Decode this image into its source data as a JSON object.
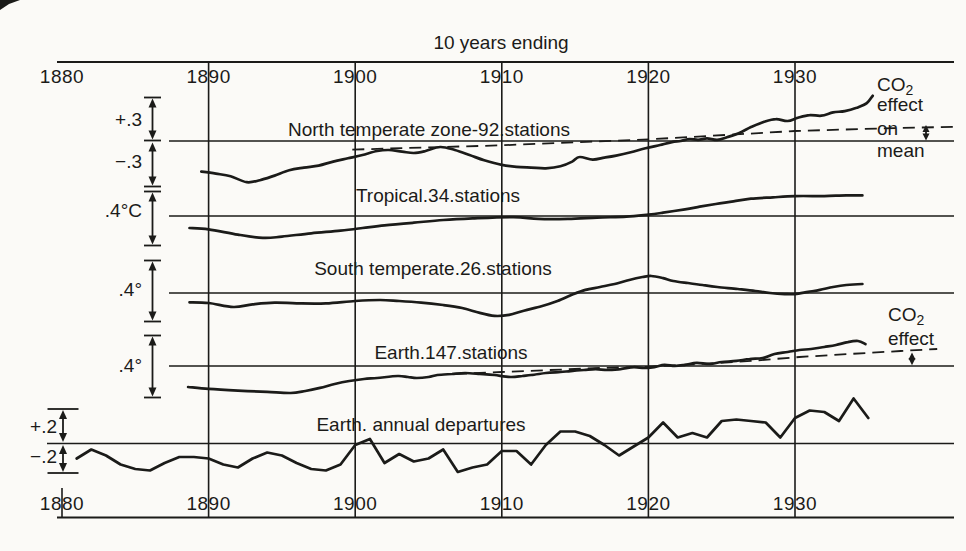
{
  "figure": {
    "top_axis_title": "10 years ending",
    "ink_color": "#1b1b19",
    "background_color": "#fbfaf7"
  },
  "axis": {
    "years": [
      "1880",
      "1890",
      "1900",
      "1910",
      "1920",
      "1930"
    ]
  },
  "scale_labels": [
    "+.3",
    "−.3",
    ".4°C",
    ".4°",
    ".4°",
    "+.2",
    "−.2"
  ],
  "annotations": {
    "co2_mean_lines": [
      "CO₂",
      "effect",
      "on",
      "mean"
    ],
    "co2_effect_lines": [
      "CO₂",
      "effect"
    ]
  },
  "chart_data": [
    {
      "panel": "north_temperate",
      "type": "line",
      "title": "North temperate zone-92.stations",
      "y_unit": "°C departure",
      "x_range": [
        1880,
        1940
      ],
      "x_ticks": [
        1880,
        1890,
        1900,
        1910,
        1920,
        1930
      ],
      "series": [
        {
          "name": "10-year running mean",
          "style": "solid",
          "interpolation": "smooth",
          "points": [
            [
              1889.5,
              -0.23
            ],
            [
              1890.5,
              -0.245
            ],
            [
              1891.5,
              -0.265
            ],
            [
              1892.6,
              -0.31
            ],
            [
              1893.5,
              -0.295
            ],
            [
              1894.5,
              -0.26
            ],
            [
              1895.5,
              -0.22
            ],
            [
              1896.5,
              -0.2
            ],
            [
              1897.5,
              -0.185
            ],
            [
              1898.5,
              -0.155
            ],
            [
              1899.5,
              -0.13
            ],
            [
              1900.5,
              -0.105
            ],
            [
              1901.5,
              -0.075
            ],
            [
              1902.3,
              -0.068
            ],
            [
              1903.2,
              -0.08
            ],
            [
              1904,
              -0.09
            ],
            [
              1904.8,
              -0.075
            ],
            [
              1905.8,
              -0.045
            ],
            [
              1906.8,
              -0.068
            ],
            [
              1907.8,
              -0.105
            ],
            [
              1908.8,
              -0.145
            ],
            [
              1910,
              -0.18
            ],
            [
              1911,
              -0.195
            ],
            [
              1912,
              -0.2
            ],
            [
              1913,
              -0.205
            ],
            [
              1914,
              -0.19
            ],
            [
              1914.8,
              -0.155
            ],
            [
              1915.3,
              -0.12
            ],
            [
              1916.2,
              -0.14
            ],
            [
              1917,
              -0.125
            ],
            [
              1917.8,
              -0.11
            ],
            [
              1918.8,
              -0.085
            ],
            [
              1919.8,
              -0.055
            ],
            [
              1920.8,
              -0.03
            ],
            [
              1921.6,
              -0.008
            ],
            [
              1922.2,
              0
            ],
            [
              1922.8,
              0.015
            ],
            [
              1923.4,
              0.008
            ],
            [
              1924,
              0.02
            ],
            [
              1924.7,
              0.008
            ],
            [
              1925.4,
              0.03
            ],
            [
              1926.2,
              0.06
            ],
            [
              1927,
              0.105
            ],
            [
              1927.9,
              0.145
            ],
            [
              1928.7,
              0.165
            ],
            [
              1929.5,
              0.15
            ],
            [
              1930.2,
              0.175
            ],
            [
              1931,
              0.195
            ],
            [
              1931.8,
              0.19
            ],
            [
              1932.6,
              0.215
            ],
            [
              1933.4,
              0.225
            ],
            [
              1934.2,
              0.25
            ],
            [
              1934.9,
              0.285
            ],
            [
              1935.3,
              0.34
            ]
          ]
        },
        {
          "name": "CO₂ effect on mean",
          "style": "dashed",
          "interpolation": "linear",
          "points": [
            [
              1899.8,
              -0.065
            ],
            [
              1910,
              -0.032
            ],
            [
              1920,
              0.012
            ],
            [
              1930,
              0.075
            ],
            [
              1936,
              0.095
            ],
            [
              1940.8,
              0.107
            ]
          ]
        }
      ]
    },
    {
      "panel": "tropical",
      "type": "line",
      "title": "Tropical.34.stations",
      "y_unit": "°C departure",
      "series": [
        {
          "name": "10-year running mean",
          "style": "solid",
          "interpolation": "smooth",
          "points": [
            [
              1888.7,
              -0.09
            ],
            [
              1890,
              -0.1
            ],
            [
              1892,
              -0.14
            ],
            [
              1893.7,
              -0.165
            ],
            [
              1895,
              -0.155
            ],
            [
              1897,
              -0.13
            ],
            [
              1899,
              -0.11
            ],
            [
              1900.5,
              -0.09
            ],
            [
              1902,
              -0.07
            ],
            [
              1904,
              -0.05
            ],
            [
              1906,
              -0.03
            ],
            [
              1908,
              -0.018
            ],
            [
              1910.8,
              -0.008
            ],
            [
              1912.5,
              -0.022
            ],
            [
              1914.5,
              -0.022
            ],
            [
              1916.5,
              -0.012
            ],
            [
              1918.5,
              -0.005
            ],
            [
              1920,
              0.01
            ],
            [
              1921,
              0.025
            ],
            [
              1922.5,
              0.05
            ],
            [
              1923.5,
              0.07
            ],
            [
              1924.6,
              0.09
            ],
            [
              1925.8,
              0.11
            ],
            [
              1927,
              0.13
            ],
            [
              1928.5,
              0.14
            ],
            [
              1930,
              0.15
            ],
            [
              1932,
              0.15
            ],
            [
              1933.5,
              0.155
            ],
            [
              1934.6,
              0.155
            ]
          ]
        }
      ]
    },
    {
      "panel": "south_temperate",
      "type": "line",
      "title": "South temperate.26.stations",
      "y_unit": "°C departure",
      "series": [
        {
          "name": "10-year running mean",
          "style": "solid",
          "interpolation": "smooth",
          "points": [
            [
              1888.7,
              -0.07
            ],
            [
              1890,
              -0.075
            ],
            [
              1891.7,
              -0.105
            ],
            [
              1893,
              -0.085
            ],
            [
              1894.5,
              -0.072
            ],
            [
              1896,
              -0.078
            ],
            [
              1898,
              -0.078
            ],
            [
              1900,
              -0.06
            ],
            [
              1901.7,
              -0.053
            ],
            [
              1903,
              -0.06
            ],
            [
              1904.5,
              -0.072
            ],
            [
              1906,
              -0.09
            ],
            [
              1907.3,
              -0.113
            ],
            [
              1908.5,
              -0.15
            ],
            [
              1909.5,
              -0.172
            ],
            [
              1910.5,
              -0.165
            ],
            [
              1911.5,
              -0.133
            ],
            [
              1912.7,
              -0.1
            ],
            [
              1913.8,
              -0.06
            ],
            [
              1914.9,
              -0.008
            ],
            [
              1915.7,
              0.023
            ],
            [
              1916.7,
              0.045
            ],
            [
              1917.7,
              0.068
            ],
            [
              1918.7,
              0.098
            ],
            [
              1919.6,
              0.12
            ],
            [
              1920.2,
              0.128
            ],
            [
              1921,
              0.112
            ],
            [
              1921.7,
              0.09
            ],
            [
              1922.7,
              0.075
            ],
            [
              1923.7,
              0.06
            ],
            [
              1924.7,
              0.045
            ],
            [
              1926.1,
              0.03
            ],
            [
              1927.3,
              0.015
            ],
            [
              1928.3,
              0
            ],
            [
              1929.3,
              -0.008
            ],
            [
              1930,
              -0.008
            ],
            [
              1930.9,
              0.008
            ],
            [
              1931.7,
              0.023
            ],
            [
              1932.6,
              0.045
            ],
            [
              1933.5,
              0.06
            ],
            [
              1934.6,
              0.068
            ]
          ]
        }
      ]
    },
    {
      "panel": "earth",
      "type": "line",
      "title": "Earth.147.stations",
      "y_unit": "°C departure",
      "series": [
        {
          "name": "10-year running mean",
          "style": "solid",
          "interpolation": "smooth",
          "points": [
            [
              1888.6,
              -0.158
            ],
            [
              1890,
              -0.172
            ],
            [
              1892,
              -0.185
            ],
            [
              1894,
              -0.195
            ],
            [
              1895.6,
              -0.203
            ],
            [
              1896.6,
              -0.188
            ],
            [
              1897.6,
              -0.165
            ],
            [
              1898.6,
              -0.135
            ],
            [
              1899.6,
              -0.113
            ],
            [
              1900.6,
              -0.098
            ],
            [
              1901.5,
              -0.09
            ],
            [
              1902.9,
              -0.075
            ],
            [
              1903.6,
              -0.083
            ],
            [
              1904.2,
              -0.09
            ],
            [
              1905,
              -0.083
            ],
            [
              1905.6,
              -0.068
            ],
            [
              1906.6,
              -0.06
            ],
            [
              1907.5,
              -0.053
            ],
            [
              1908.5,
              -0.06
            ],
            [
              1909.5,
              -0.068
            ],
            [
              1910.6,
              -0.083
            ],
            [
              1911.4,
              -0.075
            ],
            [
              1912,
              -0.068
            ],
            [
              1913,
              -0.053
            ],
            [
              1914,
              -0.045
            ],
            [
              1914.7,
              -0.038
            ],
            [
              1915.6,
              -0.03
            ],
            [
              1916.4,
              -0.023
            ],
            [
              1917.2,
              -0.03
            ],
            [
              1918.1,
              -0.023
            ],
            [
              1919,
              -0.008
            ],
            [
              1919.7,
              -0.015
            ],
            [
              1920.4,
              -0.008
            ],
            [
              1921.1,
              0.008
            ],
            [
              1921.8,
              0
            ],
            [
              1922.5,
              0.008
            ],
            [
              1923.3,
              0.023
            ],
            [
              1924.2,
              0.015
            ],
            [
              1925,
              0.03
            ],
            [
              1926,
              0.038
            ],
            [
              1926.9,
              0.053
            ],
            [
              1927.8,
              0.06
            ],
            [
              1928.6,
              0.09
            ],
            [
              1929.5,
              0.105
            ],
            [
              1930.3,
              0.12
            ],
            [
              1931.1,
              0.128
            ],
            [
              1932,
              0.143
            ],
            [
              1932.8,
              0.158
            ],
            [
              1933.6,
              0.18
            ],
            [
              1934.3,
              0.188
            ],
            [
              1934.8,
              0.165
            ]
          ]
        },
        {
          "name": "CO₂ effect",
          "style": "dashed",
          "interpolation": "linear",
          "points": [
            [
              1906.8,
              -0.06
            ],
            [
              1910,
              -0.045
            ],
            [
              1913.3,
              -0.03
            ],
            [
              1916.7,
              -0.015
            ],
            [
              1920,
              -0.005
            ],
            [
              1923.5,
              0.015
            ],
            [
              1927,
              0.038
            ],
            [
              1930.3,
              0.068
            ],
            [
              1933.7,
              0.09
            ],
            [
              1937.2,
              0.113
            ],
            [
              1939.7,
              0.128
            ]
          ]
        }
      ]
    },
    {
      "panel": "earth_annual",
      "type": "line",
      "title": "Earth. annual departures",
      "y_unit": "°C departure",
      "series": [
        {
          "name": "annual departures",
          "style": "solid",
          "interpolation": "linear",
          "points": [
            [
              1881,
              -0.1
            ],
            [
              1882,
              -0.04
            ],
            [
              1883,
              -0.08
            ],
            [
              1884,
              -0.14
            ],
            [
              1885,
              -0.17
            ],
            [
              1886,
              -0.18
            ],
            [
              1887,
              -0.13
            ],
            [
              1888,
              -0.09
            ],
            [
              1889,
              -0.09
            ],
            [
              1890,
              -0.1
            ],
            [
              1891,
              -0.14
            ],
            [
              1892,
              -0.16
            ],
            [
              1893,
              -0.1
            ],
            [
              1894,
              -0.06
            ],
            [
              1895,
              -0.08
            ],
            [
              1896,
              -0.13
            ],
            [
              1897,
              -0.17
            ],
            [
              1898,
              -0.18
            ],
            [
              1899,
              -0.14
            ],
            [
              1900,
              -0.01
            ],
            [
              1901,
              0.03
            ],
            [
              1902,
              -0.13
            ],
            [
              1903,
              -0.07
            ],
            [
              1904,
              -0.12
            ],
            [
              1905,
              -0.1
            ],
            [
              1906,
              -0.04
            ],
            [
              1907,
              -0.19
            ],
            [
              1908,
              -0.16
            ],
            [
              1909,
              -0.14
            ],
            [
              1910,
              -0.05
            ],
            [
              1911,
              -0.05
            ],
            [
              1912,
              -0.14
            ],
            [
              1913,
              -0.01
            ],
            [
              1914,
              0.08
            ],
            [
              1915,
              0.08
            ],
            [
              1916,
              0.05
            ],
            [
              1917,
              -0.01
            ],
            [
              1918,
              -0.08
            ],
            [
              1919,
              -0.02
            ],
            [
              1920,
              0.04
            ],
            [
              1921,
              0.14
            ],
            [
              1922,
              0.04
            ],
            [
              1923,
              0.07
            ],
            [
              1924,
              0.04
            ],
            [
              1925,
              0.15
            ],
            [
              1926,
              0.16
            ],
            [
              1927,
              0.15
            ],
            [
              1928,
              0.14
            ],
            [
              1929,
              0.04
            ],
            [
              1930,
              0.17
            ],
            [
              1931,
              0.22
            ],
            [
              1932,
              0.21
            ],
            [
              1933,
              0.15
            ],
            [
              1934,
              0.3
            ],
            [
              1935,
              0.17
            ]
          ]
        }
      ]
    }
  ]
}
